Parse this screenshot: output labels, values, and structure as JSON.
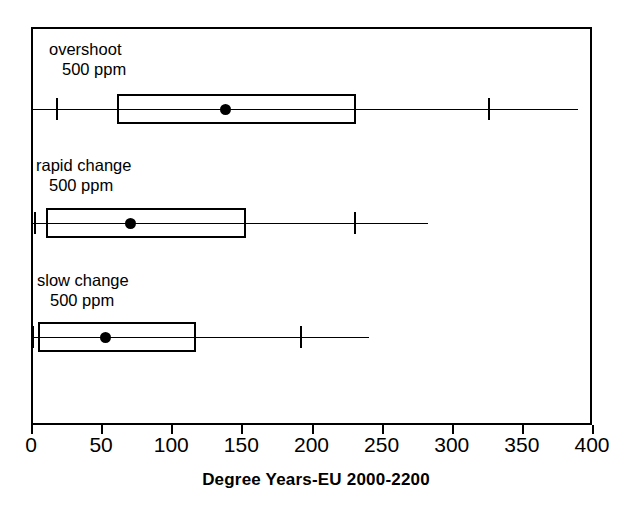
{
  "chart_data": {
    "type": "box",
    "title": "",
    "xlabel": "Degree Years-EU 2000-2200",
    "ylabel": "",
    "xlim": [
      0,
      400
    ],
    "xticks": [
      0,
      50,
      100,
      150,
      200,
      250,
      300,
      350,
      400
    ],
    "xticklabels": [
      "0",
      "50",
      "100",
      "150",
      "200",
      "250",
      "300",
      "350",
      "400"
    ],
    "grid": false,
    "legend": "none",
    "orientation": "horizontal",
    "categories": [
      "overshoot 500 ppm",
      "rapid change 500 ppm",
      "slow change 500 ppm"
    ],
    "boxes": [
      {
        "label_line1": "overshoot",
        "label_line2": "500 ppm",
        "whisker_low": 18,
        "q1": 61,
        "median_dot": 139,
        "q3": 232,
        "whisker_high": 326,
        "line_min": 0,
        "line_max": 390
      },
      {
        "label_line1": "rapid change",
        "label_line2": "500 ppm",
        "whisker_low": 2,
        "q1": 11,
        "median_dot": 71,
        "q3": 153,
        "whisker_high": 230,
        "line_min": 0,
        "line_max": 283
      },
      {
        "label_line1": "slow change",
        "label_line2": "500 ppm",
        "whisker_low": 1,
        "q1": 5,
        "median_dot": 53,
        "q3": 118,
        "whisker_high": 192,
        "line_min": 0,
        "line_max": 241
      }
    ],
    "colors": {
      "line": "#000000",
      "box_fill": "transparent",
      "marker": "#000000",
      "background": "#ffffff"
    }
  }
}
